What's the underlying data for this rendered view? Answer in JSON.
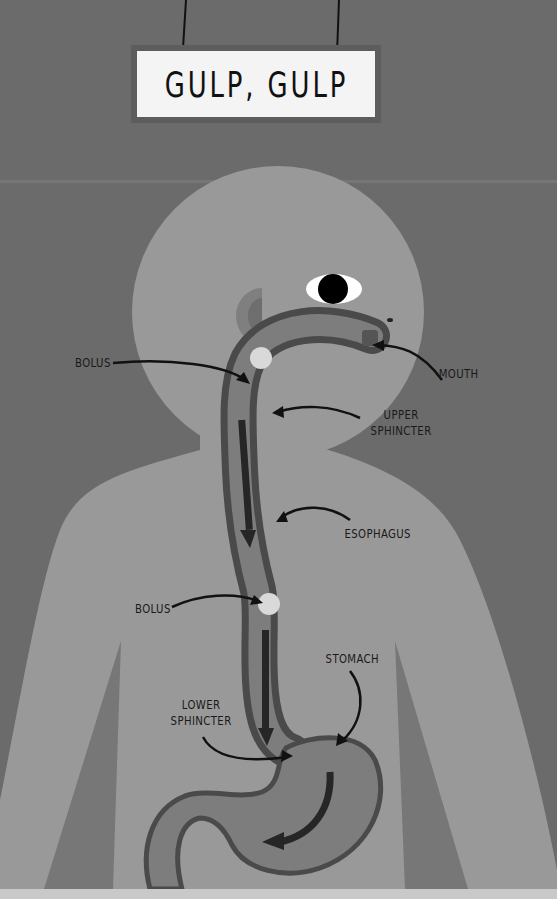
{
  "title": "GULP, GULP",
  "labels": {
    "bolus_upper": "BOLUS",
    "mouth": "MOUTH",
    "upper_sphincter": "UPPER\nSPHINCTER",
    "esophagus": "ESOPHAGUS",
    "bolus_lower": "BOLUS",
    "stomach": "STOMACH",
    "lower_sphincter": "LOWER\nSPHINCTER"
  },
  "colors": {
    "background": "#6b6b6b",
    "body": "#999999",
    "organ_outline": "#4a4a4a",
    "organ_fill": "#7d7d7d",
    "bolus": "#d9d9d9",
    "flow_arrow": "#262626",
    "sign_frame": "#5d5d5d",
    "sign_face": "#f4f4f4"
  }
}
